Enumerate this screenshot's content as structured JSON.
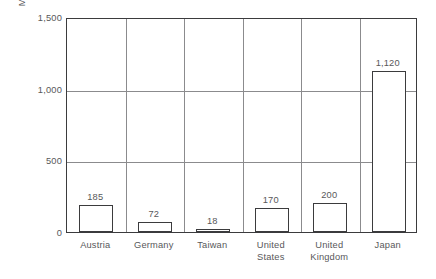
{
  "chart_data": {
    "type": "bar",
    "title": "",
    "xlabel": "",
    "ylabel": "Megabytes/1,000 employees",
    "categories": [
      "Austria",
      "Germany",
      "Taiwan",
      "United States",
      "United Kingdom",
      "Japan"
    ],
    "values": [
      185,
      72,
      18,
      170,
      200,
      1120
    ],
    "value_labels": [
      "185",
      "72",
      "18",
      "170",
      "200",
      "1,120"
    ],
    "ylim": [
      0,
      1500
    ],
    "yticks": [
      0,
      500,
      1000,
      1500
    ],
    "ytick_labels": [
      "0",
      "500",
      "1,000",
      "1,500"
    ],
    "grid": "horizontal gridlines at 500 and 1000; vertical separators between categories",
    "legend": "none",
    "colors": {
      "bar_fill": "#ffffff",
      "bar_outline": "#3b3b3d",
      "gridline": "#8b8b8d",
      "frame": "#3b3b3d",
      "text": "#58585a",
      "background": "#ffffff"
    }
  }
}
